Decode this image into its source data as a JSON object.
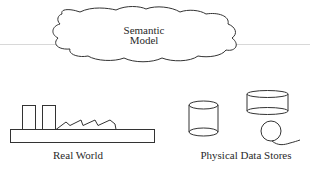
{
  "diagram": {
    "semantic_model": {
      "line1": "Semantic",
      "line2": "Model",
      "shape": "cloud-icon"
    },
    "real_world": {
      "label": "Real World",
      "shape": "factory-icon"
    },
    "physical_data_stores": {
      "label": "Physical Data Stores",
      "shapes": [
        "disk-cylinder-icon",
        "drum-cylinder-icon",
        "tape-reel-icon"
      ]
    },
    "colors": {
      "stroke": "#333333",
      "divider": "#d8d8d8",
      "background": "#ffffff"
    }
  }
}
